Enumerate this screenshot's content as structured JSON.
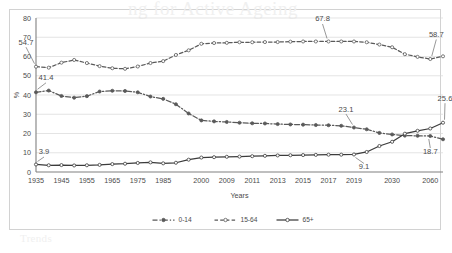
{
  "chart_data": {
    "type": "line",
    "title": "",
    "xlabel": "Years",
    "ylabel": "%",
    "ylim": [
      0,
      80
    ],
    "ytick_step": 10,
    "yticks": [
      "0",
      "10",
      "20",
      "30",
      "40",
      "50",
      "60",
      "70",
      "80"
    ],
    "grid": true,
    "legend_position": "bottom",
    "categories": [
      "1935",
      "1940",
      "1945",
      "1950",
      "1955",
      "1960",
      "1965",
      "1970",
      "1975",
      "1980",
      "1985",
      "1990",
      "1995",
      "2000",
      "2005",
      "2009",
      "2010",
      "2011",
      "2012",
      "2013",
      "2014",
      "2015",
      "2016",
      "2017",
      "2018",
      "2019",
      "2020",
      "2025",
      "2030",
      "2040",
      "2050",
      "2060",
      "2065"
    ],
    "xticks": [
      "1935",
      "1945",
      "1955",
      "1965",
      "1975",
      "1985",
      "2000",
      "2009",
      "2011",
      "2013",
      "2015",
      "2017",
      "2019",
      "2030",
      "2060"
    ],
    "series": [
      {
        "name": "0-14",
        "values": [
          41.4,
          42.3,
          39.5,
          38.6,
          39.4,
          41.8,
          42.2,
          42.1,
          41.4,
          39.2,
          38.0,
          35.2,
          30.4,
          26.8,
          26.3,
          26.0,
          25.6,
          25.3,
          25.2,
          24.9,
          24.7,
          24.6,
          24.4,
          24.3,
          24.0,
          23.1,
          22.2,
          20.3,
          19.5,
          18.9,
          18.8,
          18.7,
          17.0
        ]
      },
      {
        "name": "15-64",
        "values": [
          54.7,
          54.2,
          56.8,
          58.2,
          56.6,
          55.0,
          53.9,
          53.6,
          54.8,
          56.6,
          57.6,
          60.8,
          63.2,
          66.6,
          67.0,
          67.1,
          67.4,
          67.4,
          67.5,
          67.5,
          67.7,
          67.8,
          67.8,
          67.8,
          67.8,
          67.8,
          67.4,
          66.2,
          64.8,
          61.2,
          59.8,
          58.7,
          60.1
        ]
      },
      {
        "name": "65+",
        "values": [
          3.9,
          3.5,
          3.6,
          3.4,
          3.5,
          3.7,
          4.1,
          4.3,
          4.7,
          5.0,
          4.5,
          4.8,
          6.4,
          7.5,
          7.7,
          7.9,
          8.0,
          8.2,
          8.4,
          8.6,
          8.7,
          8.8,
          8.9,
          9.0,
          9.0,
          9.1,
          10.4,
          13.5,
          15.7,
          19.9,
          21.4,
          22.6,
          25.6
        ]
      }
    ],
    "annotations": [
      {
        "label": "54.7",
        "series": "15-64",
        "point": "1935"
      },
      {
        "label": "41.4",
        "series": "0-14",
        "point": "1935"
      },
      {
        "label": "3.9",
        "series": "65+",
        "point": "1935"
      },
      {
        "label": "67.8",
        "series": "15-64",
        "point": "2017"
      },
      {
        "label": "58.7",
        "series": "15-64",
        "point": "2060"
      },
      {
        "label": "23.1",
        "series": "0-14",
        "point": "2019"
      },
      {
        "label": "18.7",
        "series": "0-14",
        "point": "2060"
      },
      {
        "label": "9.1",
        "series": "65+",
        "point": "2019"
      },
      {
        "label": "25.6",
        "series": "65+",
        "point": "2065"
      }
    ],
    "legend": [
      {
        "label": "0-14",
        "style": "dash-dot",
        "marker": "filled-circle",
        "color": "#595959"
      },
      {
        "label": "15-64",
        "style": "dashed",
        "marker": "open-circle",
        "color": "#5a5a5a"
      },
      {
        "label": "65+",
        "style": "solid",
        "marker": "open-circle",
        "color": "#3c3c3c"
      }
    ],
    "colors": {
      "series_0_14": "#595959",
      "series_15_64": "#5a5a5a",
      "series_65plus": "#3c3c3c",
      "grid": "#d9d9d9",
      "axis": "#808080",
      "text": "#4a4a4a",
      "background": "#ffffff",
      "frame": "#d2d2d2"
    }
  },
  "ghost": {
    "title": "ng for Active Ageing",
    "subtitle": "Trends"
  }
}
